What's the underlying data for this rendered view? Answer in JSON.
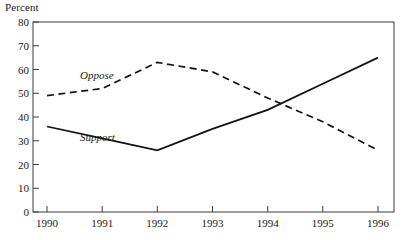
{
  "chart_data": {
    "type": "line",
    "title": "",
    "subtitle": "",
    "ylabel": "Percent",
    "xlabel": "",
    "categories": [
      "1990",
      "1991",
      "1992",
      "1993",
      "1994",
      "1995",
      "1996"
    ],
    "x": [
      1990,
      1991,
      1992,
      1993,
      1994,
      1995,
      1996
    ],
    "ylim": [
      0,
      80
    ],
    "yticks": [
      0,
      10,
      20,
      30,
      40,
      50,
      60,
      70,
      80
    ],
    "ytick_labels": [
      "0",
      "10",
      "20",
      "30",
      "40",
      "50",
      "60",
      "70",
      "80"
    ],
    "xtick_labels": [
      "1990",
      "1991",
      "1992",
      "1993",
      "1994",
      "1995",
      "1996"
    ],
    "grid": false,
    "legend_position": "inline-annotation",
    "series": [
      {
        "name": "Oppose",
        "style": "dashed",
        "color": "#111111",
        "values": [
          49,
          52,
          63,
          59,
          48,
          38,
          26
        ],
        "label_text": "Oppose"
      },
      {
        "name": "Support",
        "style": "solid",
        "color": "#111111",
        "values": [
          36,
          31,
          26,
          35,
          43,
          54,
          65
        ],
        "label_text": "Support"
      }
    ],
    "annotations": [
      {
        "text": "Oppose",
        "x": 1990.6,
        "y": 56
      },
      {
        "text": "Support",
        "x": 1990.6,
        "y": 30
      }
    ]
  },
  "axes": {
    "y_axis_title": "Percent",
    "y_tick_0": "0",
    "y_tick_10": "10",
    "y_tick_20": "20",
    "y_tick_30": "30",
    "y_tick_40": "40",
    "y_tick_50": "50",
    "y_tick_60": "60",
    "y_tick_70": "70",
    "y_tick_80": "80",
    "x_tick_1990": "1990",
    "x_tick_1991": "1991",
    "x_tick_1992": "1992",
    "x_tick_1993": "1993",
    "x_tick_1994": "1994",
    "x_tick_1995": "1995",
    "x_tick_1996": "1996"
  },
  "labels": {
    "oppose": "Oppose",
    "support": "Support"
  },
  "colors": {
    "line": "#111111",
    "frame": "#3a3a3a",
    "background": "#ffffff",
    "text": "#1a1a1a"
  }
}
